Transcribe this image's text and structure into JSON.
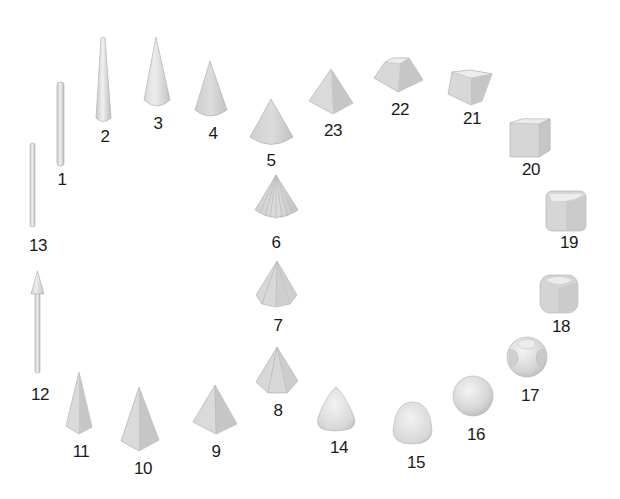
{
  "diagram": {
    "colors": {
      "fill_light": "#e8e8e8",
      "fill_mid": "#d2d2d2",
      "fill_dark": "#bdbdbd",
      "edge": "#a8a8a8",
      "label": "#1a1a1a"
    },
    "shapes": [
      {
        "id": 1,
        "label": "1",
        "kind": "thin-rod"
      },
      {
        "id": 2,
        "label": "2",
        "kind": "tapered-rod"
      },
      {
        "id": 3,
        "label": "3",
        "kind": "narrow-cone"
      },
      {
        "id": 4,
        "label": "4",
        "kind": "cone"
      },
      {
        "id": 5,
        "label": "5",
        "kind": "wide-cone"
      },
      {
        "id": 6,
        "label": "6",
        "kind": "fluted-cone"
      },
      {
        "id": 7,
        "label": "7",
        "kind": "octagonal-pyramid"
      },
      {
        "id": 8,
        "label": "8",
        "kind": "hexagonal-pyramid"
      },
      {
        "id": 9,
        "label": "9",
        "kind": "square-pyramid"
      },
      {
        "id": 10,
        "label": "10",
        "kind": "tall-square-pyramid"
      },
      {
        "id": 11,
        "label": "11",
        "kind": "narrow-pyramid"
      },
      {
        "id": 12,
        "label": "12",
        "kind": "arrow-rod"
      },
      {
        "id": 13,
        "label": "13",
        "kind": "thin-rod"
      },
      {
        "id": 14,
        "label": "14",
        "kind": "rounded-pyramid"
      },
      {
        "id": 15,
        "label": "15",
        "kind": "rounded-cone"
      },
      {
        "id": 16,
        "label": "16",
        "kind": "sphere"
      },
      {
        "id": 17,
        "label": "17",
        "kind": "spherical-cube"
      },
      {
        "id": 18,
        "label": "18",
        "kind": "rounded-cube"
      },
      {
        "id": 19,
        "label": "19",
        "kind": "soft-cube"
      },
      {
        "id": 20,
        "label": "20",
        "kind": "cube"
      },
      {
        "id": 21,
        "label": "21",
        "kind": "frustum"
      },
      {
        "id": 22,
        "label": "22",
        "kind": "tall-frustum"
      },
      {
        "id": 23,
        "label": "23",
        "kind": "square-pyramid"
      }
    ]
  }
}
